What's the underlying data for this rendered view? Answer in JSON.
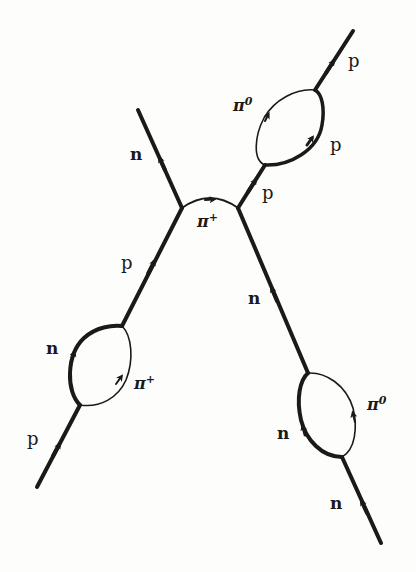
{
  "diagram": {
    "type": "feynman-diagram",
    "colors": {
      "ink": "#1a1a1a",
      "background": "#fdfdfb"
    },
    "labels": {
      "top_left_n": "n",
      "exchange_pi": {
        "base": "π",
        "sup": "+"
      },
      "left_mid_p": "p",
      "left_loop_n": "n",
      "left_loop_pi": {
        "base": "π",
        "sup": "+"
      },
      "bottom_left_p": "p",
      "right_upper_p_in": "p",
      "top_loop_pi": {
        "base": "π",
        "sup": "0"
      },
      "top_loop_p": "p",
      "top_right_p": "p",
      "right_mid_n": "n",
      "right_loop_n": "n",
      "right_loop_pi": {
        "base": "π",
        "sup": "0"
      },
      "bottom_right_n": "n"
    },
    "legs": [
      {
        "particle": "p",
        "role": "incoming",
        "position": "bottom-left"
      },
      {
        "particle": "n",
        "role": "outgoing",
        "position": "top-left"
      },
      {
        "particle": "n",
        "role": "incoming",
        "position": "bottom-right"
      },
      {
        "particle": "p",
        "role": "outgoing",
        "position": "top-right"
      }
    ],
    "exchange": {
      "particle": "π+",
      "between": [
        "left-vertex",
        "right-vertex"
      ]
    },
    "loops": [
      {
        "position": "lower-left",
        "nucleon": "n",
        "pion": "π+"
      },
      {
        "position": "upper-right",
        "nucleon": "p",
        "pion": "π0"
      },
      {
        "position": "lower-right",
        "nucleon": "n",
        "pion": "π0"
      }
    ]
  }
}
